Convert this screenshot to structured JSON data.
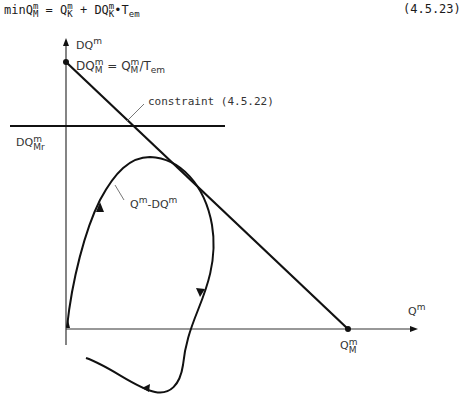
{
  "equation": {
    "prefix": "min",
    "lhs_base": "Q",
    "lhs_sup": "m",
    "lhs_sub": "M",
    "eq": " = ",
    "t1_base": "Q",
    "t1_sup": "m",
    "t1_sub": "K",
    "plus": " + ",
    "t2_base": "DQ",
    "t2_sup": "m",
    "t2_sub": "K",
    "dot": "•",
    "t3_base": "T",
    "t3_sub": "em",
    "number": "(4.5.23)"
  },
  "diagram": {
    "y_axis_label": {
      "base": "DQ",
      "sup": "m"
    },
    "x_axis_label": {
      "base": "Q",
      "sup": "m"
    },
    "intercept_label": {
      "lhs_base": "DQ",
      "lhs_sup": "m",
      "lhs_sub": "M",
      "eq": " = ",
      "rhs_base": "Q",
      "rhs_sup": "m",
      "rhs_sub": "M",
      "div": "/T",
      "div_sub": "em"
    },
    "constraint_label": "constraint (4.5.22)",
    "limit_label": {
      "base": "DQ",
      "sup": "m",
      "sub": "Mr"
    },
    "curve_label": {
      "a_base": "Q",
      "a_sup": "m",
      "dash": "-",
      "b_base": "DQ",
      "b_sup": "m"
    },
    "x_intercept_label": {
      "base": "Q",
      "sup": "m",
      "sub": "M"
    },
    "colors": {
      "line": "#111111",
      "leader": "#777777",
      "text": "#333333"
    }
  }
}
